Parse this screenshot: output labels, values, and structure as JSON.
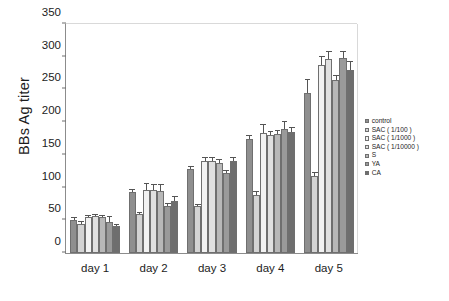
{
  "chart_data": {
    "type": "bar",
    "title": "",
    "xlabel": "",
    "ylabel": "BBs Ag titer",
    "ylim": [
      0,
      350
    ],
    "yticks": [
      0,
      50,
      100,
      150,
      200,
      250,
      300,
      350
    ],
    "grid": false,
    "legend_position": "right",
    "categories": [
      "day 1",
      "day 2",
      "day 3",
      "day 4",
      "day 5"
    ],
    "series": [
      {
        "name": "control",
        "color": "#8f8f8f",
        "values": [
          50,
          93,
          128,
          174,
          245
        ],
        "errors": [
          3,
          4,
          3,
          5,
          20
        ]
      },
      {
        "name": "SAC ( 1/100 )",
        "color": "#d3d3d3",
        "values": [
          44,
          60,
          72,
          88,
          118
        ],
        "errors": [
          4,
          2,
          2,
          5,
          4
        ]
      },
      {
        "name": "SAC ( 1/1000 )",
        "color": "#f2f2f2",
        "values": [
          55,
          96,
          140,
          184,
          287
        ],
        "errors": [
          2,
          10,
          6,
          12,
          12
        ]
      },
      {
        "name": "SAC ( 1/10000 )",
        "color": "#e0e0e0",
        "values": [
          57,
          97,
          141,
          181,
          297
        ],
        "errors": [
          2,
          7,
          5,
          4,
          10
        ]
      },
      {
        "name": "S",
        "color": "#b8b8b8",
        "values": [
          55,
          95,
          138,
          182,
          265
        ],
        "errors": [
          2,
          9,
          4,
          5,
          6
        ]
      },
      {
        "name": "YA",
        "color": "#9a9a9a",
        "values": [
          48,
          72,
          123,
          190,
          298
        ],
        "errors": [
          7,
          3,
          3,
          11,
          10
        ]
      },
      {
        "name": "CA",
        "color": "#6e6e6e",
        "values": [
          41,
          80,
          140,
          185,
          279
        ],
        "errors": [
          2,
          6,
          5,
          7,
          13
        ]
      }
    ]
  },
  "axis": {
    "y_title": "BBs Ag titer",
    "y_tick_labels": [
      "0",
      "50",
      "100",
      "150",
      "200",
      "250",
      "300",
      "350"
    ],
    "x_tick_labels": [
      "day 1",
      "day 2",
      "day 3",
      "day 4",
      "day 5"
    ]
  },
  "legend": {
    "items": [
      {
        "label": "control"
      },
      {
        "label": "SAC ( 1/100 )"
      },
      {
        "label": "SAC ( 1/1000 )"
      },
      {
        "label": "SAC ( 1/10000 )"
      },
      {
        "label": "S"
      },
      {
        "label": "YA"
      },
      {
        "label": "CA"
      }
    ]
  }
}
